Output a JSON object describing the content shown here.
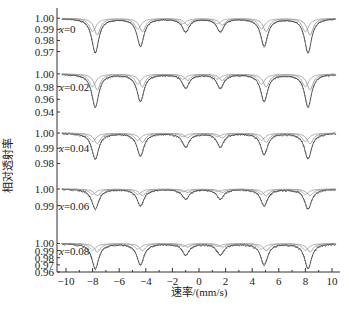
{
  "chart_data": {
    "type": "line",
    "title": "",
    "xlabel": "速率/(mm/s)",
    "ylabel": "相对透射率",
    "xlim": [
      -10.5,
      10.5
    ],
    "x_ticks": [
      -10,
      -8,
      -6,
      -4,
      -2,
      0,
      2,
      4,
      6,
      8,
      10
    ],
    "peak_positions": [
      -7.8,
      -4.4,
      -1.0,
      1.6,
      4.9,
      8.2
    ],
    "panels": [
      {
        "label": "x=0",
        "y_ticks": [
          "1.00",
          "0.99",
          "0.98",
          "0.97"
        ],
        "ylim": [
          0.966,
          1.002
        ],
        "series": [
          {
            "name": "experimental/total fit",
            "depths": [
              0.031,
              0.025,
              0.012,
              0.012,
              0.025,
              0.031
            ]
          },
          {
            "name": "subspectrum",
            "depths": [
              0.015,
              0.012,
              0.006,
              0.006,
              0.012,
              0.015
            ]
          }
        ]
      },
      {
        "label": "x=0.02",
        "y_ticks": [
          "1.00",
          "0.98",
          "0.96",
          "0.94"
        ],
        "ylim": [
          0.94,
          1.003
        ],
        "series": [
          {
            "name": "experimental/total fit",
            "depths": [
              0.052,
              0.043,
              0.022,
              0.022,
              0.043,
              0.052
            ]
          },
          {
            "name": "subspectrum",
            "depths": [
              0.025,
              0.02,
              0.01,
              0.01,
              0.02,
              0.025
            ]
          }
        ]
      },
      {
        "label": "x=0.04",
        "y_ticks": [
          "1.00",
          "0.99",
          "0.98"
        ],
        "ylim": [
          0.977,
          1.002
        ],
        "series": [
          {
            "name": "experimental/total fit",
            "depths": [
              0.017,
              0.015,
              0.009,
              0.009,
              0.014,
              0.017
            ]
          },
          {
            "name": "subspectrum",
            "depths": [
              0.007,
              0.006,
              0.003,
              0.003,
              0.006,
              0.007
            ]
          }
        ]
      },
      {
        "label": "x=0.06",
        "y_ticks": [
          "1.00",
          "0.99"
        ],
        "ylim": [
          0.985,
          1.003
        ],
        "series": [
          {
            "name": "experimental/total fit",
            "depths": [
              0.012,
              0.01,
              0.006,
              0.006,
              0.01,
              0.012
            ]
          },
          {
            "name": "subspectrum",
            "depths": [
              0.004,
              0.004,
              0.002,
              0.002,
              0.004,
              0.004
            ]
          }
        ]
      },
      {
        "label": "x=0.08",
        "y_ticks": [
          "1.00",
          "0.99",
          "0.98",
          "0.97",
          "0.96"
        ],
        "ylim": [
          0.96,
          1.002
        ],
        "series": [
          {
            "name": "experimental/total fit",
            "depths": [
              0.035,
              0.03,
              0.016,
              0.016,
              0.03,
              0.035
            ]
          },
          {
            "name": "subspectrum",
            "depths": [
              0.012,
              0.01,
              0.005,
              0.005,
              0.01,
              0.012
            ]
          }
        ]
      }
    ],
    "grid": false,
    "legend": "none"
  },
  "layout": {
    "axis_x0": 57,
    "plot_right": 340,
    "x_axis_y": 272,
    "px_per_unit": 13.3,
    "zero_px": 199,
    "panel_boxes": [
      {
        "top": 16,
        "bottom": 56
      },
      {
        "top": 72,
        "bottom": 112
      },
      {
        "top": 130,
        "bottom": 168
      },
      {
        "top": 184,
        "bottom": 214
      },
      {
        "top": 242,
        "bottom": 272
      }
    ]
  },
  "colors": {
    "axis": "#333333",
    "data": "#444444",
    "fit": "#999999"
  }
}
